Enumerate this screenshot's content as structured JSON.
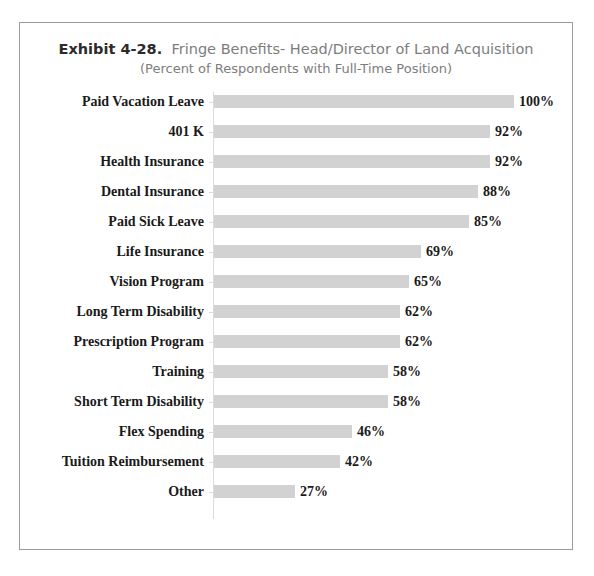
{
  "chart": {
    "exhibit_number": "Exhibit 4-28.",
    "title_rest": "Fringe Benefits- Head/Director of Land Acquisition",
    "subtitle": "(Percent of Respondents with Full-Time Position)",
    "bar_color": "#d2d2d2",
    "axis_color": "#dcdcdc",
    "border_color": "#9a9a9a",
    "text_color": "#1a1a1a",
    "title_color": "#7d7d7d"
  },
  "chart_data": {
    "type": "bar",
    "orientation": "horizontal",
    "subtitle": "(Percent of Respondents with Full-Time Position)",
    "xlabel": "",
    "ylabel": "",
    "xlim": [
      0,
      100
    ],
    "grid": false,
    "legend": false,
    "value_suffix": "%",
    "categories": [
      "Paid Vacation Leave",
      "401 K",
      "Health Insurance",
      "Dental Insurance",
      "Paid Sick Leave",
      "Life Insurance",
      "Vision Program",
      "Long Term Disability",
      "Prescription Program",
      "Training",
      "Short Term Disability",
      "Flex Spending",
      "Tuition Reimbursement",
      "Other"
    ],
    "values": [
      100,
      92,
      92,
      88,
      85,
      69,
      65,
      62,
      62,
      58,
      58,
      46,
      42,
      27
    ],
    "data_labels": [
      "100%",
      "92%",
      "92%",
      "88%",
      "85%",
      "69%",
      "65%",
      "62%",
      "62%",
      "58%",
      "58%",
      "46%",
      "42%",
      "27%"
    ]
  }
}
